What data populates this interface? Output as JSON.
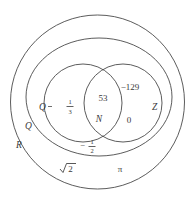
{
  "diagram": {
    "stroke_color": "#4a4a4a",
    "text_color": "#3a3a3a",
    "background_color": "#ffffff",
    "sets": [
      {
        "key": "reals",
        "label": "R",
        "shape": "circle",
        "description": "outermost circle, real numbers"
      },
      {
        "key": "rationals",
        "label": "Q",
        "shape": "ellipse",
        "description": "ellipse inside R, rational numbers"
      },
      {
        "key": "rationals_inner_tick",
        "label": "Q",
        "shape": "label-only",
        "description": "second Q label with tick inside left circle region"
      },
      {
        "key": "naturals",
        "label": "N",
        "shape": "lens",
        "description": "intersection lens of the two inner circles, natural numbers"
      },
      {
        "key": "integers",
        "label": "Z",
        "shape": "circle",
        "description": "right inner circle, integers"
      }
    ],
    "elements": [
      {
        "key": "one-third",
        "text": "1/3",
        "kind": "fraction",
        "numerator": "1",
        "denominator": "3",
        "region": "Q only (left circle, non-integer rational)"
      },
      {
        "key": "fifty-three",
        "text": "53",
        "kind": "plain",
        "region": "N (intersection lens)"
      },
      {
        "key": "neg-129",
        "text": "−129",
        "kind": "plain",
        "region": "Z only"
      },
      {
        "key": "zero",
        "text": "0",
        "kind": "plain",
        "region": "Z only"
      },
      {
        "key": "neg-half",
        "text": "-1/2",
        "kind": "fraction",
        "sign": "−",
        "numerator": "1",
        "denominator": "2",
        "region": "Q, outside the inner circles"
      },
      {
        "key": "sqrt-two",
        "text": "√2",
        "kind": "radical",
        "radicand": "2",
        "region": "R only (irrational)"
      },
      {
        "key": "pi",
        "text": "π",
        "kind": "plain",
        "region": "R only (irrational)"
      }
    ]
  }
}
